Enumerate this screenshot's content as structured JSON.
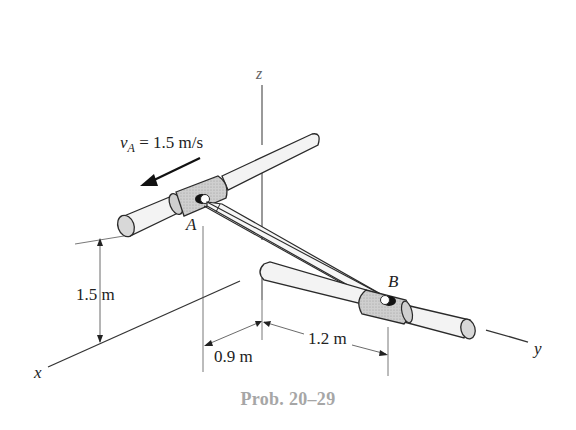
{
  "figure": {
    "title": "Prob. 20–29",
    "axes": {
      "x_label": "x",
      "y_label": "y",
      "z_label": "z"
    },
    "points": {
      "A": "A",
      "B": "B"
    },
    "velocity": {
      "symbol": "v",
      "subscript": "A",
      "equation_rest": " = 1.5 m/s",
      "value": 1.5,
      "unit": "m/s"
    },
    "dimensions": {
      "height_A": "1.5 m",
      "x_offset": "0.9 m",
      "y_offset": "1.2 m"
    },
    "colors": {
      "line": "#2a2a2a",
      "rod_fill": "#f2f2f2",
      "collar_fill": "#cfcfcf",
      "end_cap_fill": "#d8d8d8",
      "caption": "#a6a6a6"
    }
  }
}
